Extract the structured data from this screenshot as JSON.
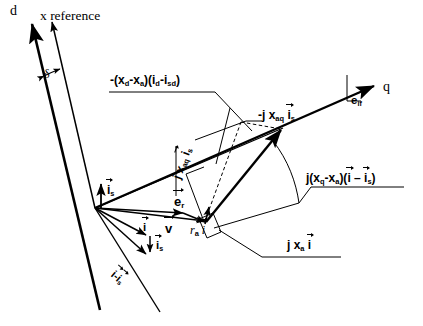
{
  "diagram": {
    "axes": [
      {
        "id": "d-axis",
        "label": "d"
      },
      {
        "id": "x-reference-axis",
        "label": "x  reference"
      },
      {
        "id": "q-axis",
        "label": "q"
      }
    ],
    "angle_label": "δ",
    "labels": {
      "d_axis": "d",
      "x_reference": "x  reference",
      "q_axis": "q",
      "delta": "δ",
      "e_if": {
        "base": "e",
        "sub": "if"
      },
      "e_r": {
        "base": "e",
        "sub": "r"
      },
      "v": {
        "base": "v"
      },
      "i": {
        "base": "i"
      },
      "i_s": {
        "base": "i",
        "sub": "s"
      },
      "i_minus_is": {
        "text": "i - i",
        "sub": "s"
      },
      "ra_i": {
        "pre": "r",
        "presub": "a",
        "base": "i"
      },
      "neg_j_xaq_is": {
        "pre": "-j  x",
        "presub": "aq",
        "base": "i",
        "sub": "s"
      },
      "j_xaq_is": {
        "pre": "j  x",
        "presub": "aq",
        "base": "i",
        "sub": "s"
      },
      "j_xa_i": {
        "pre": "j  x",
        "presub": "a",
        "base": "i"
      },
      "xd_xa_id_isd": "-(x_d - x_a)(i_d - i_sd)",
      "j_xq_xa": "j(x_q - x_a)(i - i_s)"
    },
    "formulas": {
      "top_left": {
        "parts": [
          {
            "t": "-(x"
          },
          {
            "t": "d",
            "k": "sub"
          },
          {
            "t": "-x"
          },
          {
            "t": "a",
            "k": "sub"
          },
          {
            "t": ")(i"
          },
          {
            "t": "d",
            "k": "sub"
          },
          {
            "t": "-i"
          },
          {
            "t": "sd",
            "k": "sub"
          },
          {
            "t": ")"
          }
        ],
        "plain": "-(xd-xa)(id-isd)"
      },
      "right": {
        "plain": "j(xq-xa)(i - is)"
      },
      "bottom_right": {
        "plain": "j xa i"
      }
    },
    "colors": {
      "stroke": "#000000",
      "background": "#ffffff"
    }
  }
}
